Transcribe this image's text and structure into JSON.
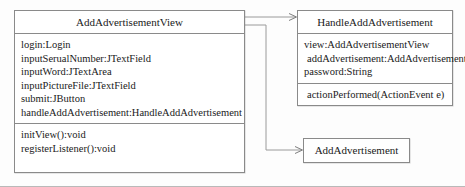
{
  "diagram": {
    "type": "uml-class-diagram",
    "background_color": "#fdfdfd",
    "line_color": "#8a8a8a",
    "text_color": "#1a1a1a",
    "classes": [
      {
        "id": "AddAdvertisementView",
        "name": "AddAdvertisementView",
        "attributes": [
          "login:Login",
          "inputSerualNumber:JTextField",
          "inputWord:JTextArea",
          "inputPictureFile:JTextField",
          "submit:JButton",
          "handleAddAdvertisement:HandleAddAdvertisement"
        ],
        "operations": [
          "initView():void",
          "registerListener():void"
        ]
      },
      {
        "id": "HandleAddAdvertisement",
        "name": "HandleAddAdvertisement",
        "attributes": [
          "view:AddAdvertisementView",
          "addAdvertisement:AddAdvertisement",
          "password:String"
        ],
        "operations": [
          "actionPerformed(ActionEvent e)"
        ]
      },
      {
        "id": "AddAdvertisement",
        "name": "AddAdvertisement",
        "attributes": [],
        "operations": []
      }
    ],
    "connectors": [
      {
        "id": "view-to-handler",
        "kind": "association-arrow",
        "from": "AddAdvertisementView",
        "to": "HandleAddAdvertisement",
        "arrowhead": "open"
      },
      {
        "id": "view-to-model",
        "kind": "association-arrow",
        "from": "AddAdvertisementView",
        "to": "AddAdvertisement",
        "arrowhead": "open"
      }
    ]
  }
}
